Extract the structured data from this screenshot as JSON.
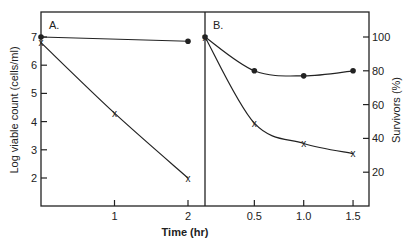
{
  "chart_data": [
    {
      "panel": "A.",
      "type": "line",
      "xlabel": "Time (hr)",
      "ylabel": "Log viable count (cells/ml)",
      "x_ticks": [
        "1",
        "2"
      ],
      "y_ticks": [
        "2",
        "3",
        "4",
        "5",
        "6",
        "7"
      ],
      "xlim": [
        0,
        2.3
      ],
      "ylim": [
        1,
        7.9
      ],
      "series": [
        {
          "name": "dots",
          "marker": "circle",
          "x": [
            0,
            2
          ],
          "y": [
            7.0,
            6.85
          ]
        },
        {
          "name": "crosses",
          "marker": "x",
          "x": [
            0,
            1,
            2
          ],
          "y": [
            6.8,
            4.3,
            2.0
          ]
        }
      ]
    },
    {
      "panel": "B.",
      "type": "line",
      "xlabel": "Time (hr)",
      "ylabel": "Survivors (%)",
      "x_ticks": [
        "0.5",
        "1.0",
        "1.5"
      ],
      "y_ticks": [
        "20",
        "40",
        "60",
        "80",
        "100"
      ],
      "xlim": [
        0,
        1.65
      ],
      "ylim": [
        0,
        115
      ],
      "series": [
        {
          "name": "dots",
          "marker": "circle",
          "x": [
            0,
            0.5,
            1.0,
            1.5
          ],
          "y": [
            100,
            80,
            77,
            80
          ]
        },
        {
          "name": "crosses",
          "marker": "x",
          "x": [
            0,
            0.5,
            1.0,
            1.5
          ],
          "y": [
            100,
            49,
            37,
            31
          ]
        }
      ]
    }
  ],
  "labels": {
    "panel_a": "A.",
    "panel_b": "B.",
    "xlabel": "Time (hr)",
    "ylabel_left": "Log viable count (cells/ml)",
    "ylabel_right": "Survivors (%)"
  }
}
